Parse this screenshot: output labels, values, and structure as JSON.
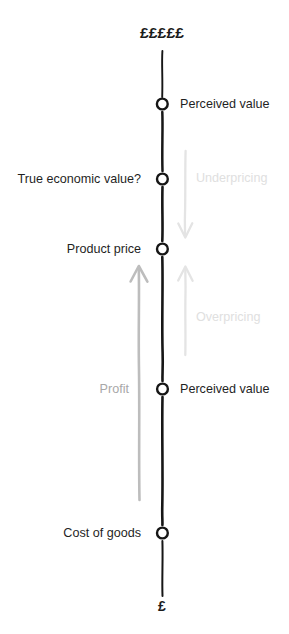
{
  "diagram": {
    "title_top": "£££££",
    "title_bottom": "£",
    "axis_color": "#1a1a1a"
  },
  "nodes": [
    {
      "label": "Perceived value",
      "side": "right",
      "y": 104,
      "tone": "dark"
    },
    {
      "label": "True economic value?",
      "side": "left",
      "y": 179,
      "tone": "dark"
    },
    {
      "label": "Product price",
      "side": "left",
      "y": 249,
      "tone": "dark"
    },
    {
      "label": "Perceived value",
      "side": "right",
      "y": 389,
      "tone": "dark"
    },
    {
      "label": "Cost of goods",
      "side": "left",
      "y": 533,
      "tone": "dark"
    }
  ],
  "annotations": [
    {
      "label": "Underpricing",
      "y": 178,
      "side": "right",
      "tone": "faint",
      "color": "#e2e2e2"
    },
    {
      "label": "Overpricing",
      "y": 317,
      "side": "right",
      "tone": "faint",
      "color": "#e2e2e2"
    },
    {
      "label": "Profit",
      "y": 389,
      "side": "left",
      "tone": "muted",
      "color": "#b5b5b5"
    }
  ],
  "arrows": [
    {
      "name": "underpricing-arrow",
      "direction": "down",
      "color": "#e4e4e4"
    },
    {
      "name": "overpricing-arrow",
      "direction": "up",
      "color": "#e4e4e4"
    },
    {
      "name": "profit-arrow",
      "direction": "up",
      "color": "#bdbdbd"
    }
  ]
}
